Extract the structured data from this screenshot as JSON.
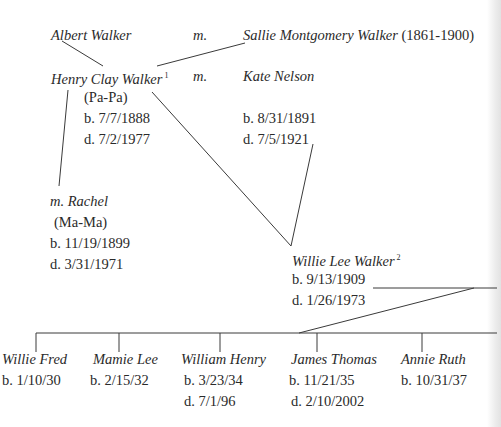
{
  "family_tree": {
    "generation1": {
      "father": {
        "name": "Albert Walker"
      },
      "marriage_label": "m.",
      "mother": {
        "name": "Sallie Montgomery Walker",
        "years": "(1861-1900)"
      }
    },
    "generation2": {
      "person": {
        "name": "Henry Clay Walker",
        "footnote": "1",
        "nickname": "(Pa-Pa)",
        "born": "b. 7/7/1888",
        "died": "d. 7/2/1977"
      },
      "marriage_label": "m.",
      "spouse1": {
        "name": "Kate Nelson",
        "born": "b. 8/31/1891",
        "died": "d. 7/5/1921"
      },
      "spouse2": {
        "name": "m. Rachel",
        "nickname": "(Ma-Ma)",
        "born": "b. 11/19/1899",
        "died": "d. 3/31/1971"
      }
    },
    "generation3": {
      "person": {
        "name": "Willie Lee Walker",
        "footnote": "2",
        "born": "b. 9/13/1909",
        "died": "d. 1/26/1973"
      }
    },
    "children": [
      {
        "name": "Willie Fred",
        "born": "b. 1/10/30"
      },
      {
        "name": "Mamie Lee",
        "born": "b. 2/15/32"
      },
      {
        "name": "William Henry",
        "born": "b. 3/23/34",
        "died": "d. 7/1/96"
      },
      {
        "name": "James Thomas",
        "born": "b. 11/21/35",
        "died": "d. 2/10/2002"
      },
      {
        "name": "Annie Ruth",
        "born": "b. 10/31/37"
      }
    ]
  },
  "colors": {
    "text": "#2a2a2a",
    "lines": "#3a3a3a",
    "background": "#ffffff"
  }
}
